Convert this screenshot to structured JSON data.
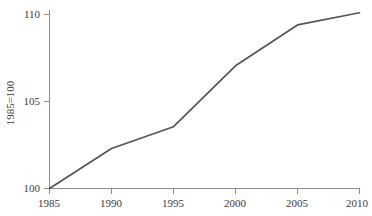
{
  "chart_data": {
    "type": "line",
    "title": "",
    "subtitle": "",
    "xlabel": "",
    "ylabel": "1985=100",
    "x": [
      1985,
      1990,
      1995,
      2000,
      2005,
      2010
    ],
    "values": [
      100,
      102.3,
      103.55,
      107.05,
      109.4,
      110.1
    ],
    "series": [
      {
        "name": "index",
        "values": [
          100,
          102.3,
          103.55,
          107.05,
          109.4,
          110.1
        ]
      }
    ],
    "xlim": [
      1985,
      2010
    ],
    "ylim": [
      100,
      110
    ],
    "xticks": [
      1985,
      1990,
      1995,
      2000,
      2005,
      2010
    ],
    "yticks": [
      100,
      105,
      110
    ],
    "xtick_labels": [
      "1985",
      "1990",
      "1995",
      "2000",
      "2005",
      "2010"
    ],
    "ytick_labels": [
      "100",
      "105",
      "110"
    ],
    "grid": false,
    "legend": false,
    "legend_position": "none",
    "line_color": "#555555",
    "axis_color": "#8c8c8c",
    "text_color": "#3a3a3a",
    "background_color": "#ffffff"
  },
  "axes": {
    "y_axis_title": "1985=100",
    "y_tick_100": "100",
    "y_tick_105": "105",
    "y_tick_110": "110",
    "x_tick_1985": "1985",
    "x_tick_1990": "1990",
    "x_tick_1995": "1995",
    "x_tick_2000": "2000",
    "x_tick_2005": "2005",
    "x_tick_2010": "2010"
  }
}
